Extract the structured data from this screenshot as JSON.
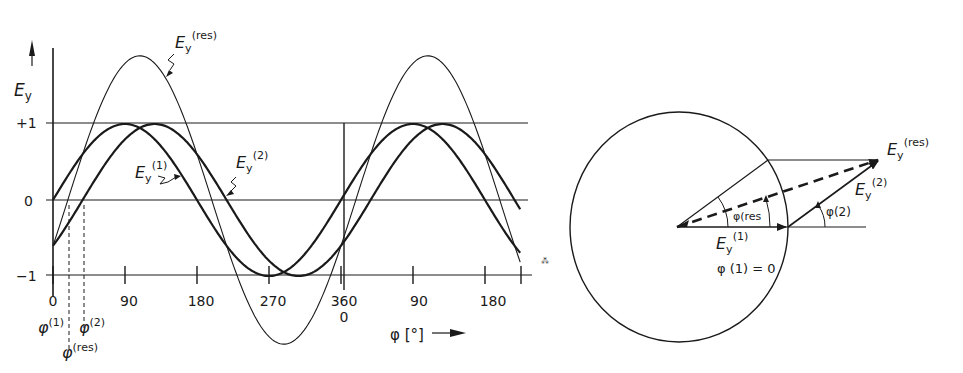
{
  "chart_data": {
    "type": "line",
    "title": "",
    "xlabel": "φ [°]",
    "ylabel": "E_y",
    "ylim": [
      -1,
      1
    ],
    "y_ticks": [
      "+1",
      "0",
      "-1"
    ],
    "x_tick_labels": [
      "0",
      "90",
      "180",
      "270",
      "360",
      "90",
      "180"
    ],
    "x_tick_sublabel_360": "0",
    "x_range_deg": [
      0,
      585
    ],
    "phase_deg": {
      "E1": 0,
      "E2": 37,
      "Eres": 18.5
    },
    "amplitude": {
      "E1": 1.0,
      "E2": 1.0,
      "Eres": 1.89
    },
    "series": [
      {
        "name": "E_y^(1)",
        "formula": "sin(φ)",
        "weight": "bold"
      },
      {
        "name": "E_y^(2)",
        "formula": "sin(φ − 37°)",
        "weight": "bold"
      },
      {
        "name": "E_y^(res)",
        "formula": "sin(φ) + sin(φ − 37°)",
        "weight": "thin"
      }
    ],
    "annotations": [
      "φ^(1)",
      "φ^(res)",
      "φ^(2)"
    ]
  },
  "left_plot": {
    "axis_label": {
      "base": "E",
      "sub": "y"
    },
    "y_labels": {
      "plus1": "+1",
      "zero": "0",
      "minus1": "−1"
    },
    "x_labels": [
      "0",
      "90",
      "180",
      "270",
      "360",
      "90",
      "180"
    ],
    "x_label_360_sub": "0",
    "x_axis_title": "φ [°]",
    "curve_labels": {
      "res": {
        "base": "E",
        "sub": "y",
        "sup": "(res)"
      },
      "e1": {
        "base": "E",
        "sub": "y",
        "sup": "(1)"
      },
      "e2": {
        "base": "E",
        "sub": "y",
        "sup": "(2)"
      }
    },
    "phase_labels": {
      "p1": {
        "base": "φ",
        "sup": "(1)"
      },
      "p2": {
        "base": "φ",
        "sup": "(2)"
      },
      "pres": {
        "base": "φ",
        "sup": "(res)"
      }
    }
  },
  "vector_diagram": {
    "labels": {
      "res": {
        "base": "E",
        "sub": "y",
        "sup": "(res)"
      },
      "e2": {
        "base": "E",
        "sub": "y",
        "sup": "(2)"
      },
      "e1": {
        "base": "E",
        "sub": "y",
        "sup": "(1)"
      },
      "phi1_eq": "φ (1) = 0",
      "phi_res": "φ(res",
      "phi2": "φ(2)"
    }
  }
}
